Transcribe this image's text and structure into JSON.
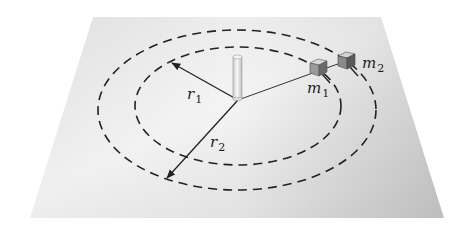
{
  "figure": {
    "labels": {
      "r1": {
        "main": "r",
        "sub": "1"
      },
      "r2": {
        "main": "r",
        "sub": "2"
      },
      "m1": {
        "main": "m",
        "sub": "1"
      },
      "m2": {
        "main": "m",
        "sub": "2"
      }
    },
    "colors": {
      "plane_light": "#f2f2f2",
      "plane_mid": "#e2e2e2",
      "plane_dark": "#cfcfcf",
      "line": "#222222",
      "cube_top": "#d9d9d9",
      "cube_front": "#8a8a8a",
      "cube_side": "#5e5e5e",
      "post": "#e6e6e6"
    }
  }
}
